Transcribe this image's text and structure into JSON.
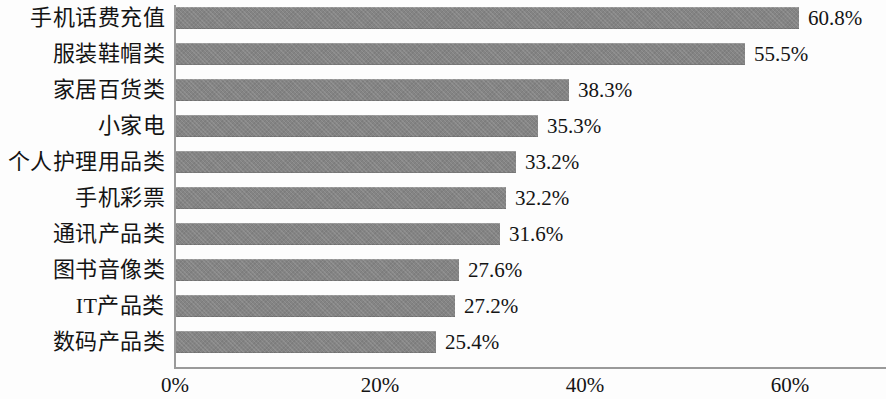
{
  "chart_data": {
    "type": "bar",
    "orientation": "horizontal",
    "title": "",
    "subtitle": "",
    "xlabel": "",
    "ylabel": "",
    "categories": [
      "手机话费充值",
      "服装鞋帽类",
      "家居百货类",
      "小家电",
      "个人护理用品类",
      "手机彩票",
      "通讯产品类",
      "图书音像类",
      "IT产品类",
      "数码产品类"
    ],
    "values": [
      60.8,
      55.5,
      38.3,
      35.3,
      33.2,
      32.2,
      31.6,
      27.6,
      27.2,
      25.4
    ],
    "value_labels": [
      "60.8%",
      "55.5%",
      "38.3%",
      "35.3%",
      "33.2%",
      "32.2%",
      "31.6%",
      "27.6%",
      "27.2%",
      "25.4%"
    ],
    "xlim": [
      0,
      69.4
    ],
    "xticks": [
      0,
      20,
      40,
      60
    ],
    "xtick_labels": [
      "0%",
      "20%",
      "40%",
      "60%"
    ],
    "grid": false,
    "legend": null,
    "bar_color": "#848484",
    "axis_color": "#9a9a9a",
    "text_color": "#141414",
    "background": "#fdfdfd"
  }
}
